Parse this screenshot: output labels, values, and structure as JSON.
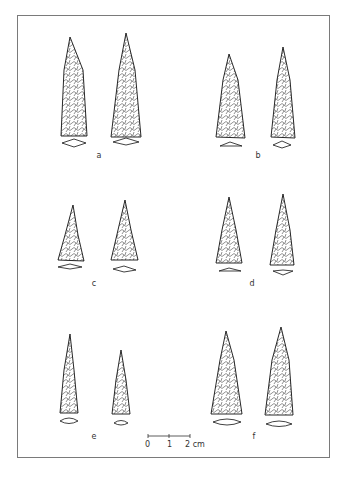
{
  "figure": {
    "labels": [
      "a",
      "b",
      "c",
      "d",
      "e",
      "f"
    ],
    "scale": {
      "zero": "0",
      "one": "1",
      "two": "2 cm"
    }
  }
}
